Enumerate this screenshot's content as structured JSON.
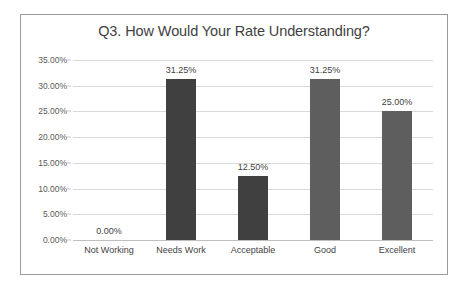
{
  "chart_data": {
    "type": "bar",
    "title": "Q3. How Would Your Rate Understanding?",
    "xlabel": "",
    "ylabel": "",
    "categories": [
      "Not Working",
      "Needs Work",
      "Acceptable",
      "Good",
      "Excellent"
    ],
    "values": [
      0.0,
      31.25,
      12.5,
      31.25,
      25.0
    ],
    "data_labels": [
      "0.00%",
      "31.25%",
      "12.50%",
      "31.25%",
      "25.00%"
    ],
    "ylim": [
      0,
      35
    ],
    "ytick_values": [
      0,
      5,
      10,
      15,
      20,
      25,
      30,
      35
    ],
    "ytick_labels": [
      "0.00%",
      "5.00%",
      "10.00%",
      "15.00%",
      "20.00%",
      "25.00%",
      "30.00%",
      "35.00%"
    ],
    "grid": true,
    "legend": false,
    "bar_colors": [
      "#404040",
      "#404040",
      "#404040",
      "#5e5e5e",
      "#5e5e5e"
    ],
    "colors": {
      "plot_background": "#ffffff",
      "gridline": "#d9d9d9",
      "baseline": "#bfbfbf",
      "border": "#9a9a9a",
      "title_text": "#3f3f3f",
      "axis_text": "#5a5a5a",
      "label_text": "#3f3f3f"
    }
  }
}
